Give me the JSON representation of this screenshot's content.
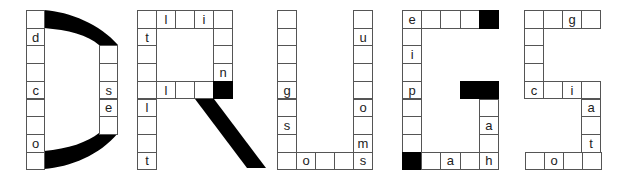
{
  "title_word": "DRUGS",
  "colors": {
    "cell_border": "#555555",
    "filled": "#000000",
    "background": "#ffffff"
  },
  "letters": [
    {
      "letter": "D",
      "cells": [
        {
          "col": 0,
          "row": 0,
          "text": ""
        },
        {
          "col": 0,
          "row": 1,
          "text": "d"
        },
        {
          "col": 0,
          "row": 2,
          "text": ""
        },
        {
          "col": 0,
          "row": 3,
          "text": ""
        },
        {
          "col": 0,
          "row": 4,
          "text": "c"
        },
        {
          "col": 0,
          "row": 5,
          "text": ""
        },
        {
          "col": 0,
          "row": 6,
          "text": ""
        },
        {
          "col": 0,
          "row": 7,
          "text": "o"
        },
        {
          "col": 0,
          "row": 8,
          "text": ""
        },
        {
          "col": 4,
          "row": 2,
          "text": ""
        },
        {
          "col": 4,
          "row": 3,
          "text": ""
        },
        {
          "col": 4,
          "row": 4,
          "text": "s"
        },
        {
          "col": 4,
          "row": 5,
          "text": "e"
        },
        {
          "col": 4,
          "row": 6,
          "text": ""
        }
      ]
    },
    {
      "letter": "R",
      "cells": [
        {
          "col": 0,
          "row": 0,
          "text": ""
        },
        {
          "col": 1,
          "row": 0,
          "text": "l"
        },
        {
          "col": 2,
          "row": 0,
          "text": ""
        },
        {
          "col": 3,
          "row": 0,
          "text": "i"
        },
        {
          "col": 4,
          "row": 0,
          "text": ""
        },
        {
          "col": 0,
          "row": 1,
          "text": "t"
        },
        {
          "col": 4,
          "row": 1,
          "text": ""
        },
        {
          "col": 0,
          "row": 2,
          "text": ""
        },
        {
          "col": 4,
          "row": 2,
          "text": ""
        },
        {
          "col": 0,
          "row": 3,
          "text": ""
        },
        {
          "col": 4,
          "row": 3,
          "text": "n"
        },
        {
          "col": 0,
          "row": 4,
          "text": ""
        },
        {
          "col": 1,
          "row": 4,
          "text": "l"
        },
        {
          "col": 2,
          "row": 4,
          "text": ""
        },
        {
          "col": 3,
          "row": 4,
          "text": ""
        },
        {
          "col": 4,
          "row": 4,
          "text": "",
          "black": true
        },
        {
          "col": 0,
          "row": 5,
          "text": "l"
        },
        {
          "col": 0,
          "row": 6,
          "text": ""
        },
        {
          "col": 0,
          "row": 7,
          "text": ""
        },
        {
          "col": 0,
          "row": 8,
          "text": "t"
        }
      ]
    },
    {
      "letter": "U",
      "cells": [
        {
          "col": 0,
          "row": 0,
          "text": ""
        },
        {
          "col": 0,
          "row": 1,
          "text": ""
        },
        {
          "col": 0,
          "row": 2,
          "text": ""
        },
        {
          "col": 0,
          "row": 3,
          "text": ""
        },
        {
          "col": 0,
          "row": 4,
          "text": "g"
        },
        {
          "col": 0,
          "row": 5,
          "text": ""
        },
        {
          "col": 0,
          "row": 6,
          "text": "s"
        },
        {
          "col": 0,
          "row": 7,
          "text": ""
        },
        {
          "col": 0,
          "row": 8,
          "text": ""
        },
        {
          "col": 1,
          "row": 8,
          "text": "o"
        },
        {
          "col": 2,
          "row": 8,
          "text": ""
        },
        {
          "col": 3,
          "row": 8,
          "text": ""
        },
        {
          "col": 4,
          "row": 8,
          "text": "s"
        },
        {
          "col": 4,
          "row": 0,
          "text": ""
        },
        {
          "col": 4,
          "row": 1,
          "text": "u"
        },
        {
          "col": 4,
          "row": 2,
          "text": ""
        },
        {
          "col": 4,
          "row": 3,
          "text": ""
        },
        {
          "col": 4,
          "row": 4,
          "text": ""
        },
        {
          "col": 4,
          "row": 5,
          "text": "o"
        },
        {
          "col": 4,
          "row": 6,
          "text": ""
        },
        {
          "col": 4,
          "row": 7,
          "text": "m"
        }
      ]
    },
    {
      "letter": "G",
      "cells": [
        {
          "col": 0,
          "row": 0,
          "text": "e"
        },
        {
          "col": 1,
          "row": 0,
          "text": ""
        },
        {
          "col": 2,
          "row": 0,
          "text": ""
        },
        {
          "col": 3,
          "row": 0,
          "text": ""
        },
        {
          "col": 4,
          "row": 0,
          "text": "",
          "black": true
        },
        {
          "col": 0,
          "row": 1,
          "text": ""
        },
        {
          "col": 0,
          "row": 2,
          "text": "i"
        },
        {
          "col": 0,
          "row": 3,
          "text": ""
        },
        {
          "col": 0,
          "row": 4,
          "text": "p"
        },
        {
          "col": 3,
          "row": 4,
          "text": "",
          "black": true
        },
        {
          "col": 4,
          "row": 4,
          "text": "",
          "black": true
        },
        {
          "col": 0,
          "row": 5,
          "text": ""
        },
        {
          "col": 4,
          "row": 5,
          "text": ""
        },
        {
          "col": 0,
          "row": 6,
          "text": ""
        },
        {
          "col": 4,
          "row": 6,
          "text": "a"
        },
        {
          "col": 0,
          "row": 7,
          "text": ""
        },
        {
          "col": 4,
          "row": 7,
          "text": ""
        },
        {
          "col": 0,
          "row": 8,
          "text": "",
          "black": true
        },
        {
          "col": 1,
          "row": 8,
          "text": ""
        },
        {
          "col": 2,
          "row": 8,
          "text": "a"
        },
        {
          "col": 3,
          "row": 8,
          "text": ""
        },
        {
          "col": 4,
          "row": 8,
          "text": "h"
        }
      ]
    },
    {
      "letter": "S",
      "cells": [
        {
          "col": 0,
          "row": 0,
          "text": ""
        },
        {
          "col": 1,
          "row": 0,
          "text": ""
        },
        {
          "col": 2,
          "row": 0,
          "text": "g"
        },
        {
          "col": 3,
          "row": 0,
          "text": ""
        },
        {
          "col": 0,
          "row": 1,
          "text": ""
        },
        {
          "col": 0,
          "row": 2,
          "text": ""
        },
        {
          "col": 0,
          "row": 3,
          "text": ""
        },
        {
          "col": 0,
          "row": 4,
          "text": "c"
        },
        {
          "col": 1,
          "row": 4,
          "text": ""
        },
        {
          "col": 2,
          "row": 4,
          "text": "i"
        },
        {
          "col": 3,
          "row": 4,
          "text": ""
        },
        {
          "col": 3,
          "row": 5,
          "text": "a"
        },
        {
          "col": 3,
          "row": 6,
          "text": ""
        },
        {
          "col": 3,
          "row": 7,
          "text": "t"
        },
        {
          "col": 0,
          "row": 8,
          "text": ""
        },
        {
          "col": 1,
          "row": 8,
          "text": "o"
        },
        {
          "col": 2,
          "row": 8,
          "text": ""
        },
        {
          "col": 3,
          "row": 8,
          "text": ""
        }
      ]
    }
  ]
}
